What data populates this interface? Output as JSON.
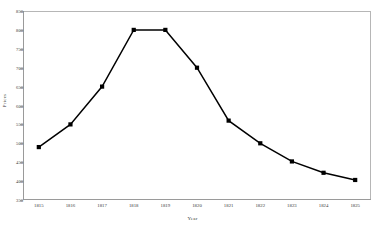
{
  "chart_data": {
    "type": "line",
    "title": "",
    "xlabel": "Year",
    "ylabel": "Prices",
    "categories": [
      "1815",
      "1816",
      "1817",
      "1818",
      "1819",
      "1820",
      "1821",
      "1822",
      "1823",
      "1824",
      "1825"
    ],
    "values": [
      490,
      550,
      650,
      800,
      800,
      700,
      560,
      500,
      452,
      422,
      403
    ],
    "series": [
      {
        "name": "Prices",
        "values": [
          490,
          550,
          650,
          800,
          800,
          700,
          560,
          500,
          452,
          422,
          403
        ],
        "color": "#000000",
        "marker": "square"
      }
    ],
    "ylim": [
      350,
      850
    ],
    "yticks": [
      350,
      400,
      450,
      500,
      550,
      600,
      650,
      700,
      750,
      800,
      850
    ],
    "ytick_labels": [
      "350",
      "400",
      "450",
      "500",
      "550",
      "600",
      "650",
      "700",
      "750",
      "800",
      "850"
    ],
    "xtick_labels": [
      "1815",
      "1816",
      "1817",
      "1818",
      "1819",
      "1820",
      "1821",
      "1822",
      "1823",
      "1824",
      "1825"
    ],
    "grid": false,
    "legend": false,
    "legend_position": "none",
    "line_color": "#000000",
    "marker_color": "#000000",
    "frame_color": "#b6b6b6",
    "background_color": "#ffffff"
  }
}
